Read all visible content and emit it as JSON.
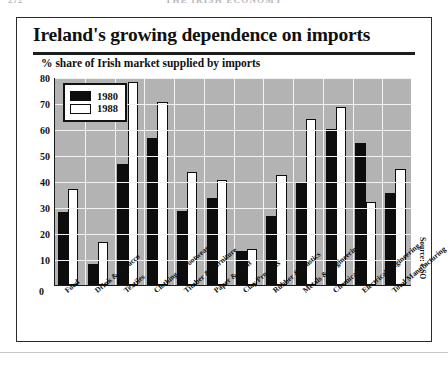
{
  "page": {
    "folio": "272",
    "running_head": "THE IRISH ECONOMY"
  },
  "figure": {
    "title": "Ireland's growing dependence on imports",
    "subtitle": "% share of Irish market supplied by imports",
    "source": "Source: CSO",
    "zero_label": "0"
  },
  "legend": {
    "items": [
      {
        "label": "1980",
        "color": "#0d0d0d",
        "swatch": "filled"
      },
      {
        "label": "1988",
        "color": "#ffffff",
        "swatch": "outline"
      }
    ]
  },
  "colors": {
    "plot_background": "#b3b3b3",
    "gridline": "#f2f2f2",
    "axis": "#1a1a1a",
    "bar_1980": "#0d0d0d",
    "bar_1988": "#ffffff",
    "frame": "#2b2b2b"
  },
  "chart_data": {
    "type": "bar",
    "title": "Ireland's growing dependence on imports",
    "subtitle": "% share of Irish market supplied by imports",
    "xlabel": "",
    "ylabel": "% share of Irish market supplied by imports",
    "ylim": [
      0,
      80
    ],
    "yticks": [
      0,
      10,
      20,
      30,
      40,
      50,
      60,
      70,
      80
    ],
    "ytick_labels": [
      "0",
      "10",
      "20",
      "30",
      "40",
      "50",
      "60",
      "70",
      "80"
    ],
    "grid": true,
    "legend_position": "top-left",
    "source": "Source: CSO",
    "categories": [
      "Food",
      "Drink & Tobacco",
      "Textiles",
      "Clothing & Footwear",
      "Timber & Furniture",
      "Paper & Print",
      "Clay Products",
      "Rubber & Plastics",
      "Metals & Engineering",
      "Chemicals",
      "Electrical Engineering",
      "Total Manufacturing"
    ],
    "series": [
      {
        "name": "1980",
        "color": "#0d0d0d",
        "values": [
          28,
          8,
          46.5,
          56.5,
          28.5,
          33.5,
          13,
          26.5,
          39.5,
          60,
          54.5,
          35.5
        ]
      },
      {
        "name": "1988",
        "color": "#ffffff",
        "values": [
          37,
          16.5,
          78,
          70.5,
          43.5,
          40.5,
          14,
          42.5,
          64,
          68.5,
          32,
          44.5
        ]
      }
    ]
  }
}
